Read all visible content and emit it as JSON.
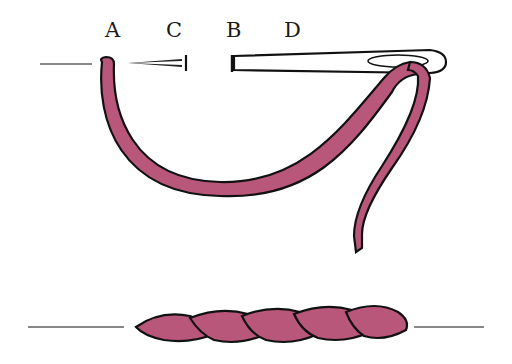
{
  "diagram": {
    "labels": {
      "a": "A",
      "c": "C",
      "b": "B",
      "d": "D"
    },
    "colors": {
      "thread": "#b8577a",
      "outline": "#111111",
      "guide_line": "#888888",
      "needle_fill": "#ffffff"
    },
    "elements": [
      "fabric-line-top",
      "thread-curve",
      "needle",
      "thread-tail",
      "fabric-line-bottom",
      "finished-stitch-twist"
    ],
    "finished_stitch_segments": 5
  }
}
